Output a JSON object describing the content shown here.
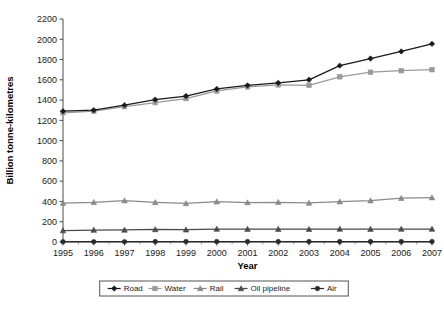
{
  "chart_data": {
    "type": "line",
    "title": "",
    "xlabel": "Year",
    "ylabel": "Billion tonne-kilometres",
    "x": [
      1995,
      1996,
      1997,
      1998,
      1999,
      2000,
      2001,
      2002,
      2003,
      2004,
      2005,
      2006,
      2007
    ],
    "xtick_labels": [
      "1995",
      "1996",
      "1997",
      "1998",
      "1999",
      "2000",
      "2001",
      "2002",
      "2003",
      "2004",
      "2005",
      "2006",
      "2007"
    ],
    "ytick_labels": [
      "0",
      "200",
      "400",
      "600",
      "800",
      "1000",
      "1200",
      "1400",
      "1600",
      "1800",
      "2000",
      "2200"
    ],
    "ylim": [
      0,
      2200
    ],
    "ytick_step": 200,
    "grid": false,
    "legend_position": "bottom",
    "series": [
      {
        "name": "Road",
        "color": "#1a1a1a",
        "marker": "diamond",
        "values": [
          1290,
          1300,
          1350,
          1405,
          1440,
          1510,
          1545,
          1570,
          1600,
          1740,
          1810,
          1880,
          1955
        ]
      },
      {
        "name": "Water",
        "color": "#9a9a9a",
        "marker": "square",
        "values": [
          1275,
          1290,
          1335,
          1375,
          1415,
          1490,
          1530,
          1550,
          1545,
          1630,
          1675,
          1690,
          1700
        ]
      },
      {
        "name": "Rail",
        "color": "#8a8a8a",
        "marker": "triangle",
        "values": [
          383,
          392,
          408,
          391,
          380,
          398,
          389,
          392,
          385,
          398,
          408,
          432,
          438
        ]
      },
      {
        "name": "Oil pipeline",
        "color": "#4a4a4a",
        "marker": "triangle",
        "values": [
          113,
          118,
          119,
          124,
          121,
          128,
          127,
          127,
          126,
          128,
          127,
          128,
          128
        ]
      },
      {
        "name": "Air",
        "color": "#2a2a2a",
        "marker": "circle",
        "values": [
          3,
          3,
          3,
          4,
          4,
          4,
          4,
          4,
          4,
          4,
          4,
          4,
          4
        ]
      }
    ]
  },
  "legend": {
    "items": [
      {
        "label": "Road"
      },
      {
        "label": "Water"
      },
      {
        "label": "Rail"
      },
      {
        "label": "Oil pipeline"
      },
      {
        "label": "Air"
      }
    ]
  }
}
